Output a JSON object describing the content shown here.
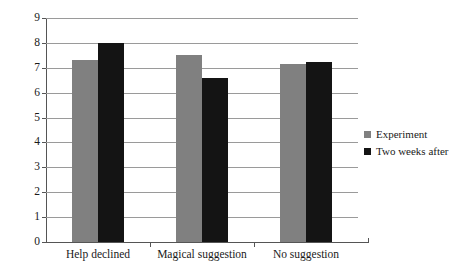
{
  "chart_data": {
    "type": "bar",
    "title": "",
    "xlabel": "",
    "ylabel": "",
    "ylim": [
      0,
      9
    ],
    "ytick_labels": [
      "9",
      "8",
      "7",
      "6",
      "5",
      "4",
      "3",
      "2",
      "1",
      "0"
    ],
    "grid": true,
    "legend_position": "right",
    "categories": [
      "Help declined",
      "Magical suggestion",
      "No suggestion"
    ],
    "series": [
      {
        "name": "Experiment",
        "color": "#808080",
        "values": [
          7.3,
          7.5,
          7.15
        ]
      },
      {
        "name": "Two weeks after",
        "color": "#141414",
        "values": [
          8.0,
          6.6,
          7.25
        ]
      }
    ]
  },
  "legend": {
    "entries": [
      {
        "label": "Experiment",
        "swatch": "legend-swatch-experiment"
      },
      {
        "label": "Two weeks after",
        "swatch": "legend-swatch-two-weeks-after"
      }
    ]
  }
}
